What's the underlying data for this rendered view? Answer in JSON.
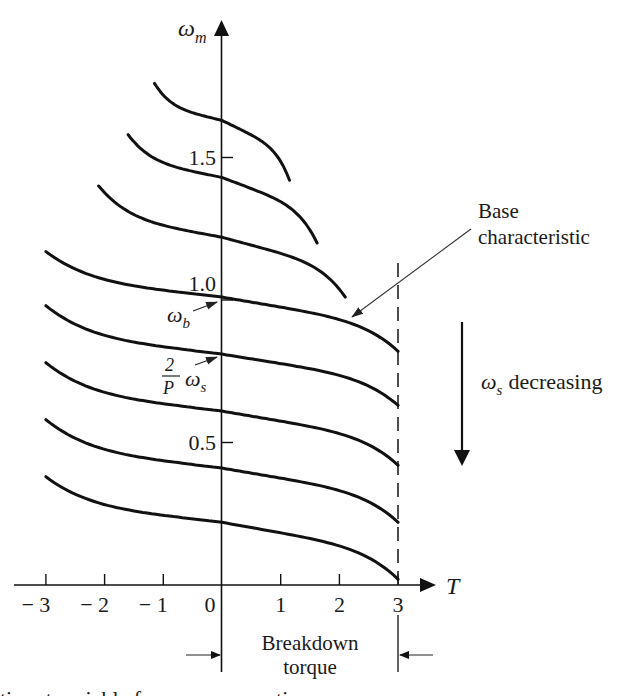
{
  "figure": {
    "y_axis_symbol": "ω",
    "y_axis_sub": "m",
    "x_axis_symbol": "T",
    "base_label_line1": "Base",
    "base_label_line2": "characteristic",
    "omega_b_symbol": "ω",
    "omega_b_sub": "b",
    "fraction_num": "2",
    "fraction_den": "P",
    "omega_s_symbol": "ω",
    "omega_s_sub": "s",
    "decreasing_symbol": "ω",
    "decreasing_sub": "s",
    "decreasing_text": "decreasing",
    "breakdown_line1": "Breakdown",
    "breakdown_line2": "torque",
    "caption_partial": "tics      at      variable frequency operation"
  },
  "chart_data": {
    "type": "line",
    "title": "",
    "xlabel": "T",
    "ylabel": "ω_m",
    "x_ticks": [
      -3,
      -2,
      -1,
      0,
      1,
      2,
      3
    ],
    "x_tick_labels": [
      "− 3",
      "− 2",
      "− 1",
      "0",
      "1",
      "2",
      "3"
    ],
    "y_ticks": [
      0.5,
      1.0,
      1.5
    ],
    "y_tick_labels": [
      "0.5",
      "1.0",
      "1.5"
    ],
    "xlim": [
      -3.4,
      3.6
    ],
    "ylim": [
      0,
      1.95
    ],
    "grid": false,
    "breakdown_torque": 3,
    "annotations": [
      {
        "text": "Base characteristic",
        "points_to": [
          2.2,
          0.94
        ]
      },
      {
        "text": "ω_b",
        "points_to": [
          0,
          1.0
        ]
      },
      {
        "text": "(2/P) ω_s",
        "points_to": [
          0,
          0.81
        ]
      },
      {
        "text": "ω_s decreasing",
        "arrow": "down"
      },
      {
        "text": "Breakdown torque",
        "span": [
          0,
          3
        ]
      }
    ],
    "series": [
      {
        "name": "curve-1",
        "omega_at_T0": 1.63,
        "T_start": -1.15,
        "T_end": 1.15,
        "omega_start": 1.76,
        "omega_end": 1.42
      },
      {
        "name": "curve-2",
        "omega_at_T0": 1.43,
        "T_start": -1.6,
        "T_end": 1.62,
        "omega_start": 1.58,
        "omega_end": 1.2
      },
      {
        "name": "curve-3",
        "omega_at_T0": 1.22,
        "T_start": -2.1,
        "T_end": 2.1,
        "omega_start": 1.4,
        "omega_end": 1.01
      },
      {
        "name": "base-characteristic",
        "omega_at_T0": 1.01,
        "T_start": -3,
        "T_end": 3,
        "omega_start": 1.17,
        "omega_end": 0.82
      },
      {
        "name": "curve-5",
        "omega_at_T0": 0.81,
        "T_start": -3,
        "T_end": 3,
        "omega_start": 0.98,
        "omega_end": 0.63
      },
      {
        "name": "curve-6",
        "omega_at_T0": 0.61,
        "T_start": -3,
        "T_end": 3,
        "omega_start": 0.78,
        "omega_end": 0.42
      },
      {
        "name": "curve-7",
        "omega_at_T0": 0.41,
        "T_start": -3,
        "T_end": 3,
        "omega_start": 0.58,
        "omega_end": 0.22
      },
      {
        "name": "curve-8",
        "omega_at_T0": 0.22,
        "T_start": -3,
        "T_end": 3,
        "omega_start": 0.38,
        "omega_end": 0.02
      }
    ]
  }
}
